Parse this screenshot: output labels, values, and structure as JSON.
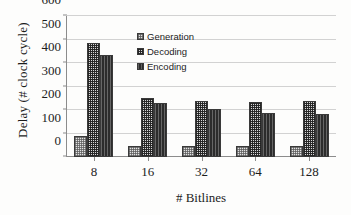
{
  "chart_data": {
    "type": "bar",
    "title": "",
    "xlabel": "# Bitlines",
    "ylabel": "Delay (# clock cycle)",
    "categories": [
      "8",
      "16",
      "32",
      "64",
      "128"
    ],
    "series": [
      {
        "name": "Generation",
        "values": [
          88,
          45,
          45,
          45,
          47
        ]
      },
      {
        "name": "Decoding",
        "values": [
          485,
          252,
          239,
          236,
          237
        ]
      },
      {
        "name": "Encoding",
        "values": [
          436,
          230,
          205,
          188,
          184
        ]
      }
    ],
    "ylim": [
      0,
      600
    ],
    "yticks": [
      0,
      100,
      200,
      300,
      400,
      500,
      600
    ],
    "grid": true,
    "legend_position": "inside-top-center",
    "colors": {
      "generation": "#e2e2e2",
      "decoding": "#d8d8d8",
      "encoding": "#2c2c2c",
      "gridline": "#d2d2d2",
      "axis": "#8c8c8c",
      "text": "#1c1c1c",
      "background": "#fdfdfc"
    }
  },
  "legend": {
    "items": [
      {
        "label": "Generation",
        "swatch": "checker-light-swatch"
      },
      {
        "label": "Decoding",
        "swatch": "checker-dark-swatch"
      },
      {
        "label": "Encoding",
        "swatch": "vertical-stripe-swatch"
      }
    ]
  }
}
